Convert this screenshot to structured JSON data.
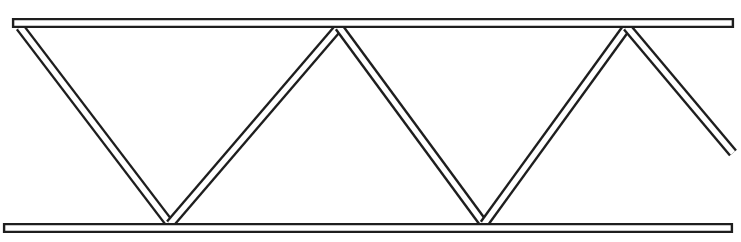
{
  "diagram": {
    "type": "warren-truss",
    "canvas": {
      "width": 741,
      "height": 242,
      "background": "#ffffff"
    },
    "colors": {
      "stroke": "#1e1e1e",
      "fill": "#ffffff"
    },
    "member_width": 7,
    "outline_width": 1.6,
    "chords": [
      {
        "name": "top-chord",
        "x1": 17,
        "y1": 23,
        "x2": 729,
        "y2": 23
      },
      {
        "name": "bottom-chord",
        "x1": 8,
        "y1": 228,
        "x2": 728,
        "y2": 228
      }
    ],
    "diagonals": [
      {
        "name": "diagonal-1",
        "x1": 20,
        "y1": 27,
        "x2": 170,
        "y2": 224
      },
      {
        "name": "diagonal-2",
        "x1": 170,
        "y1": 224,
        "x2": 339,
        "y2": 27
      },
      {
        "name": "diagonal-3",
        "x1": 339,
        "y1": 27,
        "x2": 484,
        "y2": 224
      },
      {
        "name": "diagonal-4",
        "x1": 484,
        "y1": 224,
        "x2": 627,
        "y2": 27
      },
      {
        "name": "diagonal-5",
        "x1": 627,
        "y1": 27,
        "x2": 733,
        "y2": 153
      }
    ],
    "nodes": [
      {
        "name": "node-top-left",
        "x": 20,
        "y": 27
      },
      {
        "name": "node-bottom-1",
        "x": 170,
        "y": 224
      },
      {
        "name": "node-top-2",
        "x": 339,
        "y": 27
      },
      {
        "name": "node-bottom-2",
        "x": 484,
        "y": 224
      },
      {
        "name": "node-top-3",
        "x": 627,
        "y": 27
      }
    ]
  }
}
